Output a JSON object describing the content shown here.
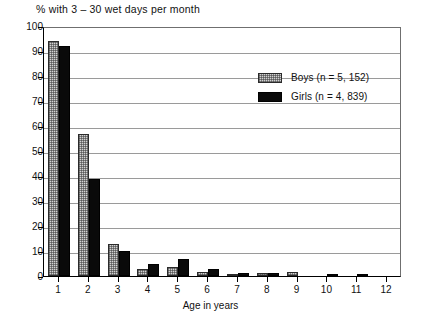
{
  "chart_data": {
    "type": "bar",
    "title": "% with 3 – 30 wet days per month",
    "xlabel": "Age in years",
    "ylabel": "",
    "categories": [
      "1",
      "2",
      "3",
      "4",
      "5",
      "6",
      "7",
      "8",
      "9",
      "10",
      "11",
      "12"
    ],
    "series": [
      {
        "name": "Boys (n = 5, 152)",
        "values": [
          94,
          57,
          13,
          3,
          3.5,
          1.5,
          1,
          1.2,
          1.5,
          0,
          0,
          0
        ]
      },
      {
        "name": "Girls (n = 4, 839)",
        "values": [
          92,
          39,
          10,
          5,
          7,
          3,
          1.2,
          1.2,
          0,
          1,
          1,
          0
        ]
      }
    ],
    "ylim": [
      0,
      100
    ],
    "ytick_step": 10,
    "yticks": [
      "0",
      "10",
      "20",
      "30",
      "40",
      "50",
      "60",
      "70",
      "80",
      "90",
      "100"
    ],
    "grid": true,
    "legend_position": "top-right",
    "colors": {
      "boys_fill": "#d2d2d2",
      "girls_fill": "#0a0a0a",
      "axis": "#000000",
      "gridline": "#9a9a9a"
    }
  },
  "legend": {
    "entries": [
      {
        "label": "Boys (n = 5, 152)",
        "swatch": "boys"
      },
      {
        "label": "Girls (n = 4, 839)",
        "swatch": "girls"
      }
    ]
  }
}
